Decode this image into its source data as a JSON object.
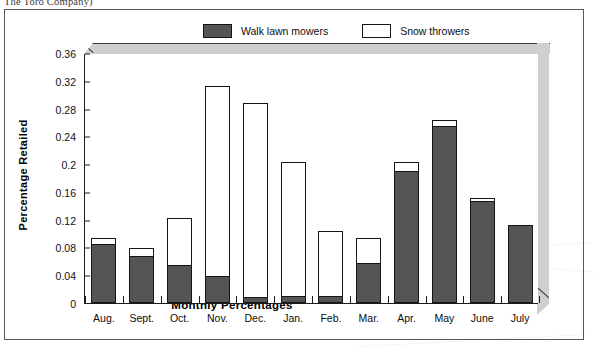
{
  "page": {
    "caption_top": "The Toro Company)"
  },
  "chart_data": {
    "type": "bar",
    "stacked": true,
    "title": "",
    "xlabel": "Monthly Percentages",
    "ylabel": "Percentage Retailed",
    "ylim": [
      0,
      0.36
    ],
    "yticks": [
      "0",
      "0.04",
      "0.08",
      "0.12",
      "0.16",
      "0.2",
      "0.24",
      "0.28",
      "0.32",
      "0.36"
    ],
    "ytick_values": [
      0,
      0.04,
      0.08,
      0.12,
      0.16,
      0.2,
      0.24,
      0.28,
      0.32,
      0.36
    ],
    "grid": false,
    "legend_position": "top-center",
    "categories": [
      "Aug.",
      "Sept.",
      "Oct.",
      "Nov.",
      "Dec.",
      "Jan.",
      "Feb.",
      "Mar.",
      "Apr.",
      "May",
      "June",
      "July"
    ],
    "series": [
      {
        "name": "Walk lawn mowers",
        "color": "#555555",
        "values": [
          0.085,
          0.067,
          0.055,
          0.039,
          0.008,
          0.01,
          0.01,
          0.058,
          0.19,
          0.255,
          0.147,
          0.113
        ]
      },
      {
        "name": "Snow throwers",
        "color": "#ffffff",
        "values": [
          0.011,
          0.014,
          0.07,
          0.276,
          0.282,
          0.195,
          0.095,
          0.038,
          0.015,
          0.01,
          0.006,
          0.0
        ]
      }
    ],
    "totals": [
      0.096,
      0.081,
      0.125,
      0.315,
      0.29,
      0.205,
      0.105,
      0.096,
      0.205,
      0.265,
      0.153,
      0.113
    ]
  }
}
